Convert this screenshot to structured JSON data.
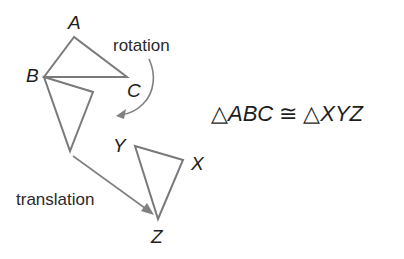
{
  "diagram": {
    "triangle_abc": {
      "vertices": {
        "A": {
          "label": "A",
          "x": 74,
          "y": 37
        },
        "B": {
          "label": "B",
          "x": 44,
          "y": 77
        },
        "C": {
          "label": "C",
          "x": 127,
          "y": 77
        }
      }
    },
    "triangle_rotated": {
      "vertices": {
        "B": {
          "x": 44,
          "y": 77
        },
        "right": {
          "x": 93,
          "y": 92
        },
        "bottom": {
          "x": 70,
          "y": 151
        }
      }
    },
    "triangle_xyz": {
      "vertices": {
        "X": {
          "label": "X",
          "x": 183,
          "y": 160
        },
        "Y": {
          "label": "Y",
          "x": 135,
          "y": 146
        },
        "Z": {
          "label": "Z",
          "x": 158,
          "y": 219
        }
      }
    },
    "transformations": {
      "rotation": {
        "label": "rotation"
      },
      "translation": {
        "label": "translation"
      }
    },
    "equation": {
      "symbol_triangle": "△",
      "left": "ABC",
      "congruent": "≅",
      "right": "XYZ"
    },
    "colors": {
      "lines": "#7a7a7a",
      "arrows": "#808080",
      "text": "#1e1e1e"
    }
  }
}
